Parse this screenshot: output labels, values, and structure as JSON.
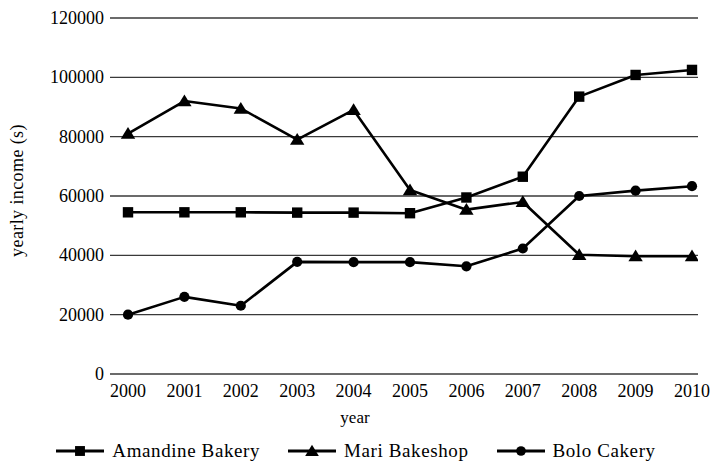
{
  "chart_data": {
    "type": "line",
    "title": "",
    "xlabel": "year",
    "ylabel": "yearly  income (s)",
    "categories": [
      "2000",
      "2001",
      "2002",
      "2003",
      "2004",
      "2005",
      "2006",
      "2007",
      "2008",
      "2009",
      "2010"
    ],
    "x": [
      2000,
      2001,
      2002,
      2003,
      2004,
      2005,
      2006,
      2007,
      2008,
      2009,
      2010
    ],
    "xlim": [
      2000,
      2010
    ],
    "ylim": [
      0,
      120000
    ],
    "yticks": [
      0,
      20000,
      40000,
      60000,
      80000,
      100000,
      120000
    ],
    "ytick_labels": [
      "0",
      "20000",
      "40000",
      "60000",
      "80000",
      "100000",
      "120000"
    ],
    "grid": "horizontal",
    "legend_position": "bottom",
    "series": [
      {
        "name": "Amandine Bakery",
        "marker": "square",
        "color": "#000000",
        "values": [
          54500,
          54500,
          54500,
          54400,
          54400,
          54200,
          59500,
          66500,
          93500,
          100800,
          102500
        ]
      },
      {
        "name": "Mari Bakeshop",
        "marker": "triangle",
        "color": "#000000",
        "values": [
          81000,
          92000,
          89500,
          79000,
          89000,
          62000,
          55400,
          58000,
          40200,
          39700,
          39700
        ]
      },
      {
        "name": "Bolo Cakery",
        "marker": "circle",
        "color": "#000000",
        "values": [
          20000,
          26000,
          23000,
          37800,
          37700,
          37700,
          36300,
          42300,
          60000,
          61800,
          63300
        ]
      }
    ]
  },
  "legend": {
    "entries": [
      {
        "label": "Amandine  Bakery",
        "marker": "square"
      },
      {
        "label": "Mari  Bakeshop",
        "marker": "triangle"
      },
      {
        "label": "Bolo  Cakery",
        "marker": "circle"
      }
    ]
  }
}
